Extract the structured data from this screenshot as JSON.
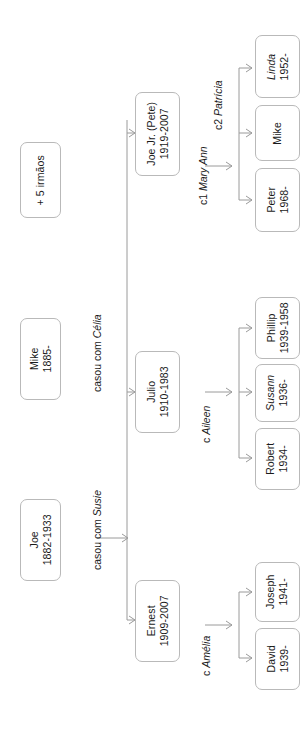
{
  "diagram": {
    "type": "family-tree",
    "orientation": "rotated-90-ccw",
    "title": "",
    "colors": {
      "box_border": "#b9b9b9",
      "connector": "#9a9a9a",
      "text": "#1a1a1a",
      "background": "#ffffff"
    }
  },
  "nodes": {
    "siblings": {
      "line1": "+ 5 irmãos",
      "line2": ""
    },
    "mike_sr": {
      "line1": "Mike",
      "line2": "1885-"
    },
    "joe_sr": {
      "line1": "Joe",
      "line2": "1882-1933"
    },
    "joe_jr": {
      "line1": "Joe Jr. (Pete)",
      "line2": "1919-2007"
    },
    "julio": {
      "line1": "Julio",
      "line2": "1910-1983"
    },
    "ernest": {
      "line1": "Ernest",
      "line2": "1909-2007"
    },
    "linda": {
      "line1": "Linda",
      "line2": "1952-"
    },
    "mike_jr": {
      "line1": "Mike",
      "line2": ""
    },
    "peter": {
      "line1": "Peter",
      "line2": "1968-"
    },
    "phillip": {
      "line1": "Phillip",
      "line2": "1939-1958"
    },
    "susann": {
      "line1": "Susann",
      "line2": "1936-"
    },
    "robert": {
      "line1": "Robert",
      "line2": "1934-"
    },
    "joseph": {
      "line1": "Joseph",
      "line2": "1941-"
    },
    "david": {
      "line1": "David",
      "line2": "1939-"
    }
  },
  "edge_labels": {
    "casou_celia_plain": "casou com ",
    "casou_celia_italic": "Célia",
    "casou_susie_plain": "casou com ",
    "casou_susie_italic": "Susie",
    "c1_prefix": "c1 ",
    "c1_italic": "Mary Ann",
    "c2_prefix": "c2 ",
    "c2_italic": "Patrícia",
    "c_aileen_prefix": "c ",
    "c_aileen_italic": "Aileen",
    "c_amelia_prefix": "c ",
    "c_amelia_italic": "Amélia"
  }
}
